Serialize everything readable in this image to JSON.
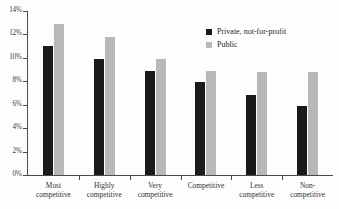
{
  "chart_data": {
    "type": "bar",
    "title": "",
    "subtitle": "",
    "xlabel": "",
    "ylabel": "",
    "ylim": [
      0,
      14
    ],
    "ytick_values": [
      0,
      2,
      4,
      6,
      8,
      10,
      12,
      14
    ],
    "ytick_labels": [
      "0%",
      "2%",
      "4%",
      "6%",
      "8%",
      "10%",
      "12%",
      "14%"
    ],
    "grid": false,
    "legend_position": "top-right-inside",
    "value_suffix": "%",
    "categories": [
      "Most competitive",
      "Highly competitive",
      "Very competitive",
      "Competitive",
      "Less competitive",
      "Non-competitive"
    ],
    "category_lines": [
      [
        "Most",
        "competitive"
      ],
      [
        "Highly",
        "competitive"
      ],
      [
        "Very",
        "competitive"
      ],
      [
        "Competitive",
        ""
      ],
      [
        "Less",
        "competitive"
      ],
      [
        "Non-",
        "competitive"
      ]
    ],
    "series": [
      {
        "name": "Private, not-for-profit",
        "color": "#1a1a1a",
        "values": [
          11.0,
          9.9,
          8.85,
          7.9,
          6.85,
          5.85
        ]
      },
      {
        "name": "Public",
        "color": "#b8b8b8",
        "values": [
          12.9,
          11.8,
          9.9,
          8.85,
          8.8,
          8.8
        ]
      }
    ],
    "annotations": []
  },
  "legend": {
    "items": [
      {
        "label": "Private, not-for-profit",
        "swatch": "private"
      },
      {
        "label": "Public",
        "swatch": "public"
      }
    ]
  },
  "colors": {
    "series_private": "#1a1a1a",
    "series_public": "#b8b8b8",
    "axis": "#4a4a4a",
    "text": "#2b2b2b",
    "background": "#fdfdfd"
  }
}
